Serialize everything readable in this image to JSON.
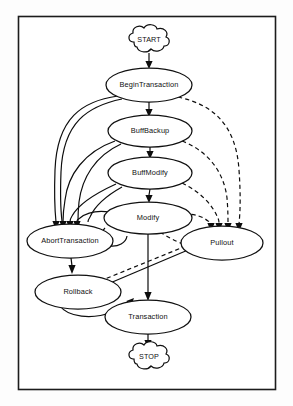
{
  "figure": {
    "kind": "state-transition-diagram",
    "frame": {
      "stroke_color": "#1c1c1c",
      "fill_color": "#ffffff"
    },
    "style": {
      "node_stroke_color": "#111111",
      "node_fill_color": "#ffffff",
      "edge_color": "#0d0d0d",
      "solid_edge_label": "solid",
      "dashed_edge_label": "dashed"
    },
    "nodes": [
      {
        "id": "start",
        "label": "START",
        "shape": "cloud",
        "cx": 149,
        "cy": 42,
        "rx": 22,
        "ry": 11
      },
      {
        "id": "begintransaction",
        "label": "BeginTransaction",
        "shape": "ellipse",
        "cx": 149,
        "cy": 85,
        "rx": 43,
        "ry": 17
      },
      {
        "id": "buffbackup",
        "label": "BuffBackup",
        "shape": "ellipse",
        "cx": 150,
        "cy": 131,
        "rx": 42,
        "ry": 16
      },
      {
        "id": "buffmodify",
        "label": "BuffModify",
        "shape": "ellipse",
        "cx": 150,
        "cy": 173,
        "rx": 42,
        "ry": 16
      },
      {
        "id": "modify",
        "label": "Modify",
        "shape": "ellipse",
        "cx": 148,
        "cy": 218,
        "rx": 44,
        "ry": 16
      },
      {
        "id": "aborttransaction",
        "label": "AbortTransaction",
        "shape": "ellipse",
        "cx": 70,
        "cy": 241,
        "rx": 43,
        "ry": 17
      },
      {
        "id": "pullout",
        "label": "Pullout",
        "shape": "ellipse",
        "cx": 222,
        "cy": 243,
        "rx": 41,
        "ry": 17
      },
      {
        "id": "rollback",
        "label": "Rollback",
        "shape": "ellipse",
        "cx": 78,
        "cy": 292,
        "rx": 43,
        "ry": 17
      },
      {
        "id": "transaction",
        "label": "Transaction",
        "shape": "ellipse",
        "cx": 148,
        "cy": 317,
        "rx": 43,
        "ry": 17
      },
      {
        "id": "stop",
        "label": "STOP",
        "shape": "cloud",
        "cx": 149,
        "cy": 359,
        "rx": 22,
        "ry": 11
      }
    ],
    "edges": [
      {
        "from": "start",
        "to": "begintransaction",
        "style": "solid"
      },
      {
        "from": "begintransaction",
        "to": "buffbackup",
        "style": "solid"
      },
      {
        "from": "buffbackup",
        "to": "buffmodify",
        "style": "solid"
      },
      {
        "from": "buffmodify",
        "to": "modify",
        "style": "solid"
      },
      {
        "from": "modify",
        "to": "transaction",
        "style": "solid"
      },
      {
        "from": "transaction",
        "to": "stop",
        "style": "solid"
      },
      {
        "from": "begintransaction",
        "to": "aborttransaction",
        "style": "solid"
      },
      {
        "from": "buffbackup",
        "to": "aborttransaction",
        "style": "solid"
      },
      {
        "from": "buffmodify",
        "to": "aborttransaction",
        "style": "solid"
      },
      {
        "from": "modify",
        "to": "aborttransaction",
        "style": "solid"
      },
      {
        "from": "aborttransaction",
        "to": "rollback",
        "style": "solid"
      },
      {
        "from": "rollback",
        "to": "transaction",
        "style": "solid"
      },
      {
        "from": "pullout",
        "to": "rollback",
        "style": "solid"
      },
      {
        "from": "begintransaction",
        "to": "pullout",
        "style": "dashed"
      },
      {
        "from": "buffbackup",
        "to": "pullout",
        "style": "dashed"
      },
      {
        "from": "buffmodify",
        "to": "pullout",
        "style": "dashed"
      },
      {
        "from": "modify",
        "to": "pullout",
        "style": "dashed"
      },
      {
        "from": "pullout",
        "to": "rollback",
        "style": "dashed"
      }
    ]
  }
}
